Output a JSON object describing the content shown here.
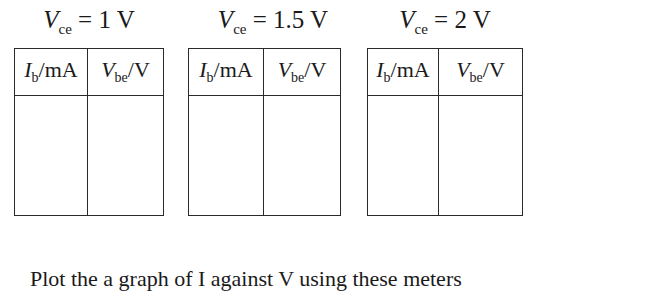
{
  "tables": [
    {
      "caption_var": "V",
      "caption_sub": "ce",
      "caption_value": " = 1 V",
      "columns": [
        {
          "var": "I",
          "sub": "b",
          "unit": "/mA"
        },
        {
          "var": "V",
          "sub": "be",
          "unit": "/V"
        }
      ],
      "rows": [
        [
          "",
          ""
        ]
      ]
    },
    {
      "caption_var": "V",
      "caption_sub": "ce",
      "caption_value": " = 1.5 V",
      "columns": [
        {
          "var": "I",
          "sub": "b",
          "unit": "/mA"
        },
        {
          "var": "V",
          "sub": "be",
          "unit": "/V"
        }
      ],
      "rows": [
        [
          "",
          ""
        ]
      ]
    },
    {
      "caption_var": "V",
      "caption_sub": "ce",
      "caption_value": " = 2 V",
      "columns": [
        {
          "var": "I",
          "sub": "b",
          "unit": "/mA"
        },
        {
          "var": "V",
          "sub": "be",
          "unit": "/V"
        }
      ],
      "rows": [
        [
          "",
          ""
        ]
      ]
    }
  ],
  "footer_text": "Plot the a graph of I against V using these meters"
}
